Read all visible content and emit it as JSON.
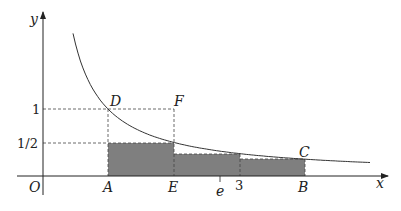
{
  "diagram": {
    "axes": {
      "x_label": "x",
      "y_label": "y",
      "origin_label": "O"
    },
    "y_ticks": [
      {
        "label": "1",
        "value": 1
      },
      {
        "label": "1/2",
        "value": 0.5
      }
    ],
    "x_ticks": [
      {
        "label": "e",
        "value": 2.718
      }
    ],
    "points": {
      "A": {
        "label": "A",
        "x": 1,
        "y": 0
      },
      "E": {
        "label": "E",
        "x": 2,
        "y": 0
      },
      "three": {
        "label": "3",
        "x": 3,
        "y": 0
      },
      "B": {
        "label": "B",
        "x": 4,
        "y": 0
      },
      "D": {
        "label": "D",
        "x": 1,
        "y": 1
      },
      "F": {
        "label": "F",
        "x": 2,
        "y": 1
      },
      "C": {
        "label": "C",
        "x": 4,
        "y": 0.25
      }
    },
    "curve": {
      "equation": "y = 1/x",
      "x_start": 0.47,
      "x_end": 4.97
    },
    "rectangles": [
      {
        "x_from": 1,
        "x_to": 2,
        "height": 0.5
      },
      {
        "x_from": 2,
        "x_to": 3,
        "height": 0.3333
      },
      {
        "x_from": 3,
        "x_to": 4,
        "height": 0.25
      }
    ],
    "colors": {
      "fill": "#808080",
      "line": "#333333"
    }
  }
}
